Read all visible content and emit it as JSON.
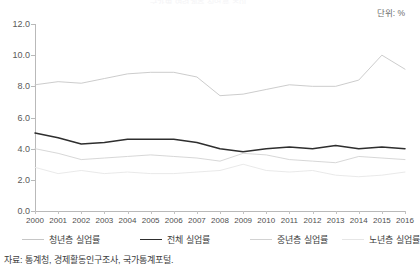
{
  "title_fragment": "국가별 연령계층 실업률 추이",
  "unit_label": "단위: %",
  "source_note": "자료: 통계청, 경제활동인구조사, 국가통계포털.",
  "legend": {
    "items": [
      {
        "label": "청년층 실업률",
        "color": "#c6c6c6",
        "width": 1.0
      },
      {
        "label": "전체 실업률",
        "color": "#2e2e2e",
        "width": 1.6
      },
      {
        "label": "중년층 실업률",
        "color": "#d2d2d2",
        "width": 1.0
      },
      {
        "label": "노년층 실업률",
        "color": "#e6e6e6",
        "width": 1.0
      }
    ]
  },
  "chart_data": {
    "type": "line",
    "title": "국가별 연령계층 실업률 추이",
    "xlabel": "",
    "ylabel": "",
    "unit": "%",
    "grid": false,
    "legend_position": "bottom",
    "xlim": [
      2000,
      2016
    ],
    "ylim": [
      0.0,
      12.0
    ],
    "ytick_step": 2.0,
    "ytick_labels": [
      "0.0",
      "2.0",
      "4.0",
      "6.0",
      "8.0",
      "10.0",
      "12.0"
    ],
    "ytick_values": [
      0.0,
      2.0,
      4.0,
      6.0,
      8.0,
      10.0,
      12.0
    ],
    "categories": [
      2000,
      2001,
      2002,
      2003,
      2004,
      2005,
      2006,
      2007,
      2008,
      2009,
      2010,
      2011,
      2012,
      2013,
      2014,
      2015,
      2016
    ],
    "x": [
      "2000",
      "2001",
      "2002",
      "2003",
      "2004",
      "2005",
      "2006",
      "2007",
      "2008",
      "2009",
      "2010",
      "2011",
      "2012",
      "2013",
      "2014",
      "2015",
      "2016"
    ],
    "series": [
      {
        "name": "청년층 실업률",
        "color": "#c6c6c6",
        "values": [
          8.1,
          8.3,
          8.2,
          8.5,
          8.8,
          8.9,
          8.9,
          8.6,
          7.4,
          7.5,
          7.8,
          8.1,
          8.0,
          8.0,
          8.4,
          10.0,
          9.1
        ]
      },
      {
        "name": "전체 실업률",
        "color": "#2e2e2e",
        "values": [
          5.0,
          4.7,
          4.3,
          4.4,
          4.6,
          4.6,
          4.6,
          4.4,
          4.0,
          3.8,
          4.0,
          4.1,
          4.0,
          4.2,
          4.0,
          4.1,
          4.0
        ]
      },
      {
        "name": "중년층 실업률",
        "color": "#d2d2d2",
        "values": [
          4.0,
          3.7,
          3.3,
          3.4,
          3.5,
          3.6,
          3.5,
          3.4,
          3.2,
          3.7,
          3.6,
          3.3,
          3.2,
          3.1,
          3.5,
          3.4,
          3.3
        ]
      },
      {
        "name": "노년층 실업률",
        "color": "#e6e6e6",
        "values": [
          2.8,
          2.4,
          2.6,
          2.4,
          2.5,
          2.4,
          2.4,
          2.5,
          2.6,
          3.0,
          2.6,
          2.5,
          2.6,
          2.3,
          2.2,
          2.3,
          2.5
        ]
      }
    ]
  }
}
